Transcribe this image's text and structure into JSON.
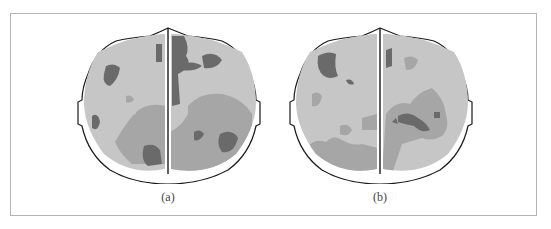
{
  "figure": {
    "panels": [
      {
        "id": "a",
        "caption": "(a)"
      },
      {
        "id": "b",
        "caption": "(b)"
      }
    ],
    "colors": {
      "light_region": "#c6c6c6",
      "medium_region": "#a6a6a6",
      "dark_region": "#6a6a6a",
      "outline": "#1a1a1a",
      "frame": "#b4b4b4"
    }
  }
}
